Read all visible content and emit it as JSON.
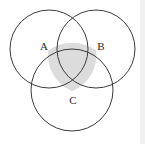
{
  "figure": {
    "kind": "venn-diagram",
    "width": 145,
    "height": 144,
    "background_color": "#ffffff",
    "stroke_color": "#3b3b3b",
    "stroke_width": 1,
    "shaded_region_color": "#dcdcdc",
    "edge_band_color": "#f1f1f1"
  },
  "circles": [
    {
      "id": "circle-a",
      "name": "top-left-circle",
      "cx": 49,
      "cy": 49,
      "r": 39,
      "fill": "none"
    },
    {
      "id": "circle-b",
      "name": "top-right-circle",
      "cx": 96,
      "cy": 49,
      "r": 39,
      "fill": "none"
    },
    {
      "id": "circle-c",
      "name": "bottom-circle",
      "cx": 72,
      "cy": 90,
      "r": 41,
      "fill": "none"
    }
  ],
  "shaded_region": {
    "name": "central-intersection",
    "description": "Intersection of all three circles",
    "color": "#dcdcdc",
    "path": "M 48.2 50.4 A 41 41 0 0 1 96.1 50.4 A 39 39 0 0 1 72.2 91.2 A 39 39 0 0 1 48.2 50.4 Z"
  },
  "labels": [
    {
      "id": "label-a",
      "text": "A",
      "x": 44,
      "y": 47
    },
    {
      "id": "label-b",
      "text": "B",
      "x": 101,
      "y": 47
    },
    {
      "id": "label-c",
      "text": "C",
      "x": 73,
      "y": 101
    }
  ]
}
